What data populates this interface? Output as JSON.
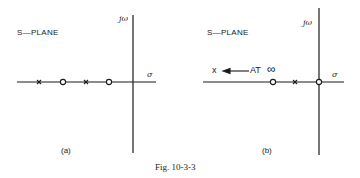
{
  "figure": {
    "caption": "Fig. 10-3-3",
    "panels": [
      {
        "id": "a",
        "title": "S—PLANE",
        "sublabel": "(a)",
        "vertical_axis_label": "jω",
        "horizontal_axis_label": "σ",
        "markers": [
          {
            "type": "pole",
            "symbol": "x",
            "position": "far left"
          },
          {
            "type": "zero",
            "symbol": "o",
            "position": "left"
          },
          {
            "type": "pole",
            "symbol": "x",
            "position": "middle"
          },
          {
            "type": "zero",
            "symbol": "o",
            "position": "near origin"
          }
        ]
      },
      {
        "id": "b",
        "title": "S—PLANE",
        "sublabel": "(b)",
        "vertical_axis_label": "jω",
        "horizontal_axis_label": "σ",
        "annotation": {
          "symbol": "x",
          "text": "AT",
          "infinity": "∞"
        },
        "markers": [
          {
            "type": "zero",
            "symbol": "o",
            "position": "left"
          },
          {
            "type": "pole",
            "symbol": "x",
            "position": "middle"
          },
          {
            "type": "zero",
            "symbol": "o",
            "position": "origin"
          }
        ]
      }
    ]
  }
}
